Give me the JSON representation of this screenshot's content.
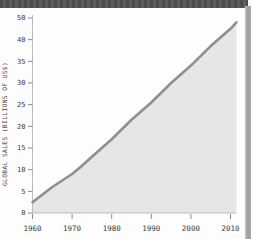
{
  "decor": {
    "top_bar_color": "#525154",
    "right_strip_color": "#a8a8a8",
    "page_bg": "#fdfdfd"
  },
  "chart_data": {
    "type": "area",
    "title": "",
    "xlabel": "",
    "ylabel": "GLOBAL SALES (BILLIONS OF US$)",
    "x": [
      1960,
      1965,
      1970,
      1972,
      1975,
      1980,
      1985,
      1990,
      1995,
      2000,
      2005,
      2010,
      2011.5
    ],
    "values": [
      2.5,
      6,
      9,
      10.5,
      13,
      17,
      21.5,
      25.5,
      30,
      34,
      38.5,
      45,
      48
    ],
    "series_name": "Global sales",
    "xticks": [
      1960,
      1970,
      1980,
      1990,
      2000,
      2010
    ],
    "ytick_labels_top_to_bottom": [
      "50",
      "40",
      "35",
      "30",
      "25",
      "20",
      "15",
      "10",
      "5",
      "0"
    ],
    "xlim": [
      1960,
      2011.5
    ],
    "ylim": [
      0,
      50
    ],
    "grid": false,
    "legend": false,
    "line_color": "#8f8f8f",
    "fill_color": "#e6e6e6",
    "axis_color": "#bdbdbd",
    "tick_color": "#8a8a8a"
  }
}
